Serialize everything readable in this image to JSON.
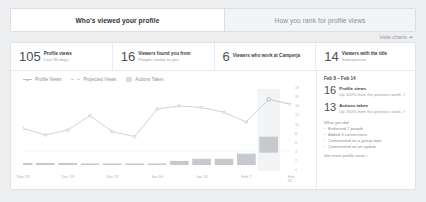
{
  "tabs": [
    {
      "label": "Who's viewed your profile",
      "active": true
    },
    {
      "label": "How you rank for profile views",
      "active": false
    }
  ],
  "hide_charts": {
    "label": "Hide charts",
    "icon": "chevron-up-icon"
  },
  "stats": [
    {
      "number": "105",
      "title": "Profile views",
      "subtitle": "Last 90 days"
    },
    {
      "number": "16",
      "title": "Viewers found you from",
      "subtitle": "People similar to you"
    },
    {
      "number": "6",
      "title": "Viewers who work at Camperja",
      "subtitle": ""
    },
    {
      "number": "14",
      "title": "Viewers with the title",
      "subtitle": "Salesperson"
    }
  ],
  "legend": [
    {
      "label": "Profile Views",
      "marker": "line-dot",
      "color": "#b9bfc5"
    },
    {
      "label": "Projected Views",
      "marker": "dashed-line",
      "color": "#cdd2d7"
    },
    {
      "label": "Actions Taken",
      "marker": "swatch",
      "color": "#dadde0"
    }
  ],
  "detail": {
    "range": "Feb 8 – Feb 14",
    "metrics": [
      {
        "number": "16",
        "title": "Profile views",
        "subtitle": "Up 100% from the previous week ↗"
      },
      {
        "number": "13",
        "title": "Actions taken",
        "subtitle": "Up 160% from the previous week ↗"
      }
    ],
    "what_you_did_heading": "What you did:",
    "what_you_did": [
      "Endorsed 7 people",
      "Added 3 connections",
      "Commented on a group topic",
      "Commented on an update"
    ],
    "cta": "Get more profile views ›"
  },
  "chart_data": {
    "type": "line",
    "title": "",
    "xlabel": "",
    "ylabel": "",
    "grid": true,
    "legend_position": "top-left",
    "x_tick_labels": [
      "Nov 29",
      "Dec 13",
      "Dec 27",
      "Jan 10",
      "Jan 24",
      "Feb 7",
      "Feb 21"
    ],
    "y_tick_labels": [
      "18",
      "16",
      "14",
      "12",
      "10",
      "8",
      "6",
      "4",
      "2",
      "0"
    ],
    "ylim": [
      0,
      18
    ],
    "highlight_index": 11,
    "highlight_label": "Feb 8 – Feb 14",
    "series": [
      {
        "name": "Profile Views",
        "type": "line",
        "color": "#b9bfc5",
        "values": [
          7,
          5,
          6.5,
          11,
          6,
          4.5,
          13,
          14,
          13.5,
          12,
          9,
          16,
          14.5
        ]
      },
      {
        "name": "Projected Views",
        "type": "line-dashed",
        "color": "#cdd2d7",
        "values": [
          null,
          null,
          null,
          null,
          null,
          null,
          null,
          null,
          null,
          null,
          null,
          16,
          14.5
        ]
      },
      {
        "name": "Actions Taken",
        "type": "bar",
        "color": "#c6cace",
        "values": [
          0.4,
          0.4,
          0.4,
          0.3,
          0.3,
          0.3,
          0.3,
          0.8,
          1.2,
          1.2,
          2.2,
          5.5,
          0
        ]
      }
    ]
  }
}
